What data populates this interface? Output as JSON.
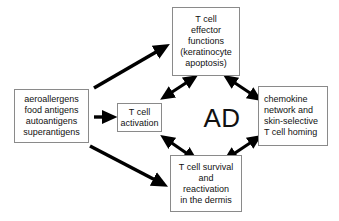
{
  "diagram": {
    "center_label": "AD",
    "colors": {
      "background": "#ffffff",
      "box_border": "#8a8a8a",
      "text": "#111111",
      "arrow": "#000000"
    },
    "boxes": {
      "stimuli": {
        "name": "antigen-stimuli-box",
        "lines": [
          "aeroallergens",
          "food antigens",
          "autoantigens",
          "superantigens"
        ]
      },
      "activation": {
        "name": "t-cell-activation-box",
        "lines": [
          "T cell",
          "activation"
        ]
      },
      "effector": {
        "name": "t-cell-effector-functions-box",
        "lines": [
          "T cell",
          "effector",
          "functions",
          "(keratinocyte",
          "apoptosis)"
        ]
      },
      "chemokine": {
        "name": "chemokine-network-box",
        "lines": [
          "chemokine",
          "network and",
          "skin-selective",
          "T cell homing"
        ]
      },
      "survival": {
        "name": "t-cell-survival-box",
        "lines": [
          "T cell survival",
          "and",
          "reactivation",
          "in the dermis"
        ]
      }
    },
    "arrows": [
      {
        "name": "arrow-stimuli-to-activation",
        "from": "stimuli",
        "to": "activation",
        "heads": "single",
        "style": "thick-horizontal"
      },
      {
        "name": "arrow-stimuli-to-effector",
        "from": "stimuli",
        "to": "effector",
        "heads": "single",
        "style": "thick-diagonal-up"
      },
      {
        "name": "arrow-stimuli-to-survival",
        "from": "stimuli",
        "to": "survival",
        "heads": "single",
        "style": "thick-diagonal-down"
      },
      {
        "name": "arrow-ad-to-effector",
        "from": "AD",
        "to": "effector",
        "heads": "double",
        "style": "diagonal-up-left"
      },
      {
        "name": "arrow-ad-to-survival",
        "from": "AD",
        "to": "survival",
        "heads": "double",
        "style": "diagonal-down-left"
      },
      {
        "name": "arrow-effector-to-chemokine",
        "from": "effector",
        "to": "chemokine",
        "heads": "double",
        "style": "diagonal-down-right"
      },
      {
        "name": "arrow-survival-to-chemokine",
        "from": "survival",
        "to": "chemokine",
        "heads": "double",
        "style": "diagonal-up-right"
      }
    ]
  }
}
